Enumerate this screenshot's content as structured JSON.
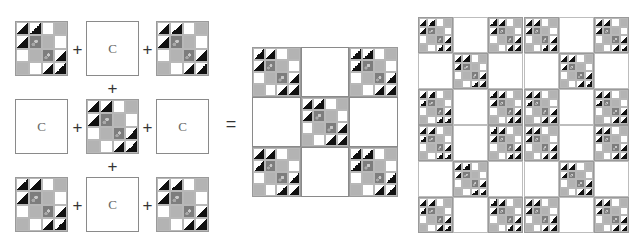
{
  "diagram": {
    "plus_sign": "+",
    "equals_sign": "=",
    "plain_block_label": "C",
    "colors": {
      "black": "#111111",
      "light_gray": "#b3b3b3",
      "dark_print": "#7d7d7d",
      "white": "#ffffff",
      "border": "#8a8a8a"
    },
    "pieced_block_pattern": [
      [
        "hst",
        "hst",
        "white",
        "gray"
      ],
      [
        "hst",
        "print",
        "gray",
        "white"
      ],
      [
        "white",
        "gray",
        "print",
        "hst"
      ],
      [
        "gray",
        "white",
        "hst",
        "hst"
      ]
    ],
    "assembly_grid": [
      [
        "pieced",
        "C",
        "pieced"
      ],
      [
        "C",
        "pieced",
        "C"
      ],
      [
        "pieced",
        "C",
        "pieced"
      ]
    ],
    "quilt_layout": {
      "large_blocks_rows": 2,
      "large_blocks_cols": 2,
      "total_rows": 6,
      "total_cols": 6
    }
  }
}
